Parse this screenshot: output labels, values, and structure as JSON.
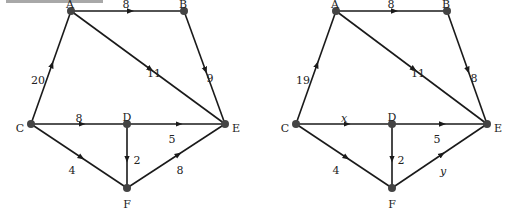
{
  "decor": {
    "top_bar_color": "#a8a8a8"
  },
  "graphs": [
    {
      "id": "left",
      "nodes": [
        {
          "name": "A",
          "x": 71,
          "y": 11,
          "lx": 70,
          "ly": 4
        },
        {
          "name": "B",
          "x": 184,
          "y": 11,
          "lx": 183,
          "ly": 4
        },
        {
          "name": "C",
          "x": 31,
          "y": 124,
          "lx": 20,
          "ly": 128
        },
        {
          "name": "D",
          "x": 127,
          "y": 124,
          "lx": 127,
          "ly": 117
        },
        {
          "name": "E",
          "x": 225,
          "y": 124,
          "lx": 236,
          "ly": 128
        },
        {
          "name": "F",
          "x": 127,
          "y": 188,
          "lx": 127,
          "ly": 204
        }
      ],
      "edges": [
        {
          "from": "A",
          "to": "B",
          "label": "8",
          "lx": 126,
          "ly": 4
        },
        {
          "from": "A",
          "to": "E",
          "label": "11",
          "lx": 154,
          "ly": 73
        },
        {
          "from": "B",
          "to": "E",
          "label": "9",
          "lx": 210,
          "ly": 78
        },
        {
          "from": "C",
          "to": "A",
          "label": "20",
          "lx": 38,
          "ly": 80
        },
        {
          "from": "C",
          "to": "D",
          "label": "8",
          "lx": 79,
          "ly": 118
        },
        {
          "from": "D",
          "to": "E",
          "label": "5",
          "lx": 172,
          "ly": 139
        },
        {
          "from": "D",
          "to": "F",
          "label": "2",
          "lx": 137,
          "ly": 160
        },
        {
          "from": "C",
          "to": "F",
          "label": "4",
          "lx": 72,
          "ly": 170
        },
        {
          "from": "F",
          "to": "E",
          "label": "8",
          "lx": 180,
          "ly": 170
        }
      ]
    },
    {
      "id": "right",
      "nodes": [
        {
          "name": "A",
          "x": 336,
          "y": 11,
          "lx": 335,
          "ly": 4
        },
        {
          "name": "B",
          "x": 447,
          "y": 11,
          "lx": 446,
          "ly": 4
        },
        {
          "name": "C",
          "x": 296,
          "y": 124,
          "lx": 285,
          "ly": 128
        },
        {
          "name": "D",
          "x": 392,
          "y": 124,
          "lx": 392,
          "ly": 117
        },
        {
          "name": "E",
          "x": 487,
          "y": 124,
          "lx": 498,
          "ly": 128
        },
        {
          "name": "F",
          "x": 392,
          "y": 188,
          "lx": 392,
          "ly": 204
        }
      ],
      "edges": [
        {
          "from": "A",
          "to": "B",
          "label": "8",
          "lx": 391,
          "ly": 4
        },
        {
          "from": "A",
          "to": "E",
          "label": "11",
          "lx": 418,
          "ly": 73
        },
        {
          "from": "B",
          "to": "E",
          "label": "8",
          "lx": 474,
          "ly": 78
        },
        {
          "from": "C",
          "to": "A",
          "label": "19",
          "lx": 303,
          "ly": 80
        },
        {
          "from": "C",
          "to": "D",
          "label": "x",
          "lx": 344,
          "ly": 118,
          "italic": true
        },
        {
          "from": "D",
          "to": "E",
          "label": "5",
          "lx": 437,
          "ly": 139
        },
        {
          "from": "D",
          "to": "F",
          "label": "2",
          "lx": 401,
          "ly": 160
        },
        {
          "from": "C",
          "to": "F",
          "label": "4",
          "lx": 336,
          "ly": 170
        },
        {
          "from": "F",
          "to": "E",
          "label": "y",
          "lx": 443,
          "ly": 171,
          "italic": true
        }
      ]
    }
  ]
}
